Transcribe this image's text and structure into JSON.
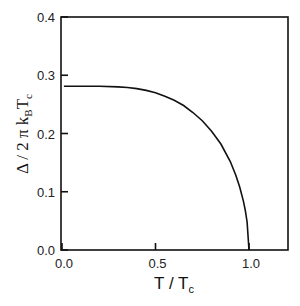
{
  "chart_data": {
    "type": "line",
    "title": "",
    "xlabel": "T / T_c",
    "ylabel": "Δ / 2 π k_B T_c",
    "xlim": [
      0.0,
      1.2
    ],
    "ylim": [
      0.0,
      0.4
    ],
    "x_ticks": [
      "0.0",
      "0.5",
      "1.0"
    ],
    "y_ticks": [
      "0.0",
      "0.1",
      "0.2",
      "0.3",
      "0.4"
    ],
    "grid": false,
    "legend": null,
    "series": [
      {
        "name": "BCS gap",
        "x": [
          0.01,
          0.1,
          0.2,
          0.3,
          0.35,
          0.4,
          0.45,
          0.5,
          0.55,
          0.6,
          0.65,
          0.7,
          0.75,
          0.8,
          0.85,
          0.9,
          0.93,
          0.95,
          0.97,
          0.98,
          0.99,
          1.0
        ],
        "values": [
          0.281,
          0.281,
          0.281,
          0.28,
          0.279,
          0.277,
          0.274,
          0.27,
          0.264,
          0.257,
          0.248,
          0.236,
          0.222,
          0.204,
          0.182,
          0.152,
          0.128,
          0.108,
          0.084,
          0.068,
          0.048,
          0.0
        ]
      }
    ]
  },
  "labels": {
    "y_title_main": "Δ / 2 π k",
    "y_title_sub1": "B",
    "y_title_t": "T",
    "y_title_sub2": "c",
    "x_title_main": "T / T",
    "x_title_sub": "c"
  }
}
